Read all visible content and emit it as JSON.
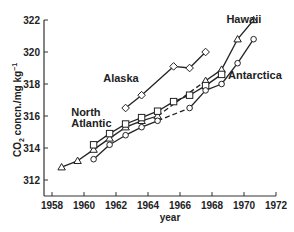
{
  "chart_data": {
    "type": "line",
    "title": "",
    "xlabel": "year",
    "ylabel": "CO2 concn./mg kg-1",
    "xlim": [
      1958,
      1972
    ],
    "ylim": [
      312,
      322
    ],
    "xticks": [
      1958,
      1960,
      1962,
      1964,
      1966,
      1968,
      1970,
      1972
    ],
    "yticks": [
      312,
      314,
      316,
      318,
      320,
      322
    ],
    "grid": false,
    "series": [
      {
        "name": "Hawaii",
        "marker": "triangle",
        "x": [
          1958.6,
          1959.6,
          1960.6,
          1961.6,
          1962.6,
          1963.6,
          1964.6,
          1967.6,
          1968.6,
          1969.6,
          1970.6
        ],
        "y": [
          312.8,
          313.2,
          313.9,
          314.6,
          315.3,
          315.7,
          316.0,
          318.2,
          318.9,
          320.8,
          322.0
        ],
        "dashed_segment": [
          1964.6,
          1967.6
        ]
      },
      {
        "name": "Alaska",
        "marker": "diamond",
        "x": [
          1962.6,
          1963.6,
          1965.6,
          1966.6,
          1967.6
        ],
        "y": [
          316.5,
          317.3,
          319.1,
          319.0,
          320.0
        ]
      },
      {
        "name": "North Atlantic",
        "marker": "square",
        "x": [
          1960.6,
          1961.6,
          1962.6,
          1963.6,
          1964.6,
          1965.6,
          1966.6,
          1967.6,
          1968.6
        ],
        "y": [
          314.2,
          314.9,
          315.5,
          315.9,
          316.3,
          316.9,
          317.3,
          317.9,
          318.6
        ]
      },
      {
        "name": "Antarctica",
        "marker": "circle",
        "x": [
          1960.6,
          1961.6,
          1962.6,
          1963.6,
          1964.6,
          1966.6,
          1967.6,
          1968.6,
          1969.6,
          1970.6
        ],
        "y": [
          313.3,
          314.2,
          314.8,
          315.3,
          315.7,
          316.5,
          317.6,
          318.0,
          319.3,
          320.8
        ],
        "dashed_segment": [
          1964.6,
          1966.6
        ]
      }
    ],
    "annotations": [
      {
        "text": "Hawaii",
        "x": 1968.9,
        "y": 321.8
      },
      {
        "text": "Alaska",
        "x": 1961.2,
        "y": 318.1
      },
      {
        "text": "North",
        "x": 1959.2,
        "y": 316.0
      },
      {
        "text": "Atlantic",
        "x": 1959.2,
        "y": 315.3
      },
      {
        "text": "Antarctica",
        "x": 1969.0,
        "y": 318.3
      }
    ]
  },
  "labels": {
    "xlabel": "year",
    "ylabel_main": "CO",
    "ylabel_sub": "2",
    "ylabel_rest": " concn./mg kg",
    "ylabel_sup": "−1",
    "hawaii": "Hawaii",
    "alaska": "Alaska",
    "north": "North",
    "atlantic": "Atlantic",
    "antarctica": "Antarctica"
  }
}
